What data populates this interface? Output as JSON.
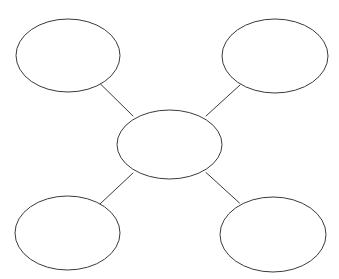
{
  "diagram": {
    "type": "concept-map",
    "title": "",
    "background_color": "#ffffff",
    "stroke_color": "#3a3a3a",
    "fill_color": "#ffffff",
    "stroke_width": 1,
    "canvas": {
      "width": 339,
      "height": 279
    },
    "center_node": {
      "name": "center-node",
      "label": "",
      "cx": 169.5,
      "cy": 144.5,
      "rx": 52.5,
      "ry": 34.5
    },
    "satellite_nodes": [
      {
        "name": "top-left-node",
        "label": "",
        "cx": 68,
        "cy": 55.5,
        "rx": 52,
        "ry": 36.5
      },
      {
        "name": "top-right-node",
        "label": "",
        "cx": 275,
        "cy": 56,
        "rx": 53,
        "ry": 37
      },
      {
        "name": "bottom-left-node",
        "label": "",
        "cx": 67.5,
        "cy": 233,
        "rx": 52.5,
        "ry": 37
      },
      {
        "name": "bottom-right-node",
        "label": "",
        "cx": 273,
        "cy": 234.5,
        "rx": 53,
        "ry": 37.5
      }
    ],
    "connectors": [
      {
        "name": "connector-center-to-top-left",
        "label": "",
        "x1": 133,
        "y1": 116,
        "x2": 100.5,
        "y2": 84
      },
      {
        "name": "connector-center-to-top-right",
        "label": "",
        "x1": 206,
        "y1": 116,
        "x2": 240,
        "y2": 85
      },
      {
        "name": "connector-center-to-bottom-left",
        "label": "",
        "x1": 133,
        "y1": 173,
        "x2": 100,
        "y2": 204
      },
      {
        "name": "connector-center-to-bottom-right",
        "label": "",
        "x1": 206,
        "y1": 172.5,
        "x2": 239.5,
        "y2": 203
      }
    ]
  }
}
